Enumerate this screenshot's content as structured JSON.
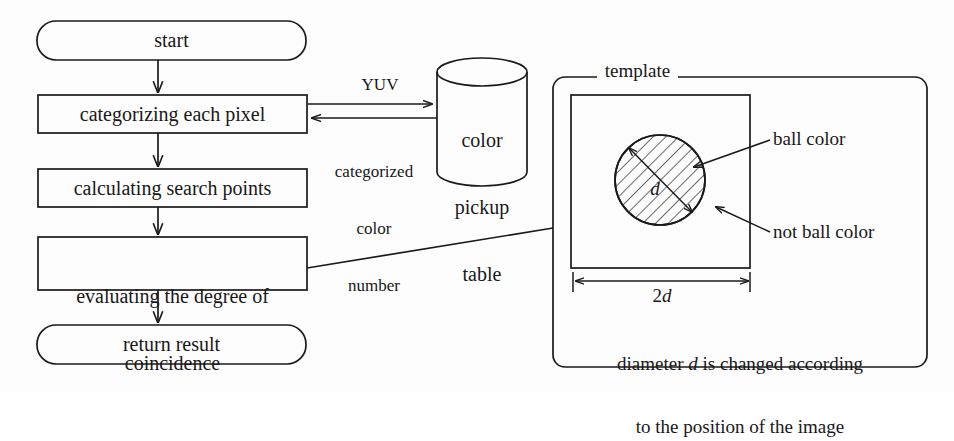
{
  "figure": {
    "type": "flowchart-with-schematic",
    "background_color": "#fdfdfd",
    "line_color": "#1a1a1a"
  },
  "flowchart": {
    "nodes": [
      {
        "id": "start",
        "shape": "rounded-terminator",
        "label": "start"
      },
      {
        "id": "categorize",
        "shape": "process",
        "label": "categorizing each pixel"
      },
      {
        "id": "search_points",
        "shape": "process",
        "label": "calculating search points"
      },
      {
        "id": "evaluate",
        "shape": "process",
        "label_line1": "evaluating the degree of",
        "label_line2": "coincidence"
      },
      {
        "id": "return",
        "shape": "rounded-terminator",
        "label": "return result"
      }
    ],
    "datastore": {
      "id": "color_pickup_table",
      "shape": "cylinder",
      "label_line1": "color",
      "label_line2": "pickup",
      "label_line3": "table"
    },
    "edges": [
      {
        "from": "start",
        "to": "categorize",
        "label": ""
      },
      {
        "from": "categorize",
        "to": "search_points",
        "label": ""
      },
      {
        "from": "search_points",
        "to": "evaluate",
        "label": ""
      },
      {
        "from": "evaluate",
        "to": "return",
        "label": ""
      },
      {
        "from": "categorize",
        "to": "color_pickup_table",
        "label": "YUV"
      },
      {
        "from": "color_pickup_table",
        "to": "categorize",
        "label_line1": "categorized",
        "label_line2": "color",
        "label_line3": "number"
      },
      {
        "from": "evaluate",
        "to": "template_panel",
        "label": ""
      }
    ]
  },
  "template_panel": {
    "title": "template",
    "square": {
      "shape": "square",
      "meaning": "template region"
    },
    "circle": {
      "shape": "hatched-circle",
      "meaning": "ball color region"
    },
    "annotations": [
      {
        "id": "ball-color",
        "label": "ball color",
        "points_to": "hatched circle"
      },
      {
        "id": "not-ball-color",
        "label": "not ball color",
        "points_to": "square outside circle"
      }
    ],
    "dimensions": [
      {
        "id": "diameter",
        "label": "d",
        "italic": true,
        "meaning": "circle diameter"
      },
      {
        "id": "square-width",
        "label_prefix": "2",
        "label_symbol": "d",
        "label": "2d",
        "meaning": "square side length"
      }
    ],
    "caption_line1_a": "diameter ",
    "caption_line1_symbol": "d",
    "caption_line1_b": " is changed according",
    "caption_line2": "to the position of the image"
  }
}
